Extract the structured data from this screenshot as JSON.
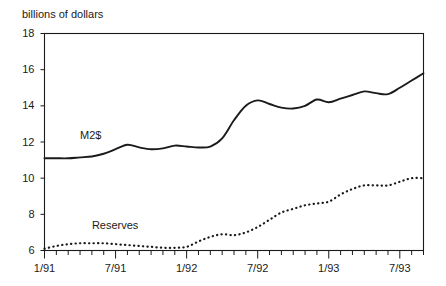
{
  "chart_data": {
    "type": "line",
    "title": "",
    "ylabel": "billions of dollars",
    "xlabel": "",
    "ylim": [
      6,
      18
    ],
    "yticks": [
      6,
      8,
      10,
      12,
      14,
      16,
      18
    ],
    "xlim": [
      "1/91",
      "9/93"
    ],
    "xticks": [
      "1/91",
      "7/91",
      "1/92",
      "7/92",
      "1/93",
      "7/93"
    ],
    "xtick_all_months": 33,
    "grid": false,
    "legend": "inline-labels",
    "x": [
      "1/91",
      "2/91",
      "3/91",
      "4/91",
      "5/91",
      "6/91",
      "7/91",
      "8/91",
      "9/91",
      "10/91",
      "11/91",
      "12/91",
      "1/92",
      "2/92",
      "3/92",
      "4/92",
      "5/92",
      "6/92",
      "7/92",
      "8/92",
      "9/92",
      "10/92",
      "11/92",
      "12/92",
      "1/93",
      "2/93",
      "3/93",
      "4/93",
      "5/93",
      "6/93",
      "7/93",
      "8/93",
      "9/93"
    ],
    "series": [
      {
        "name": "M2$",
        "style": "solid",
        "color": "#1a1a1a",
        "label_x": "4/91",
        "label_y": 12.35,
        "values": [
          11.1,
          11.1,
          11.1,
          11.15,
          11.2,
          11.35,
          11.6,
          11.85,
          11.7,
          11.6,
          11.65,
          11.8,
          11.75,
          11.7,
          11.75,
          12.2,
          13.2,
          14.0,
          14.3,
          14.1,
          13.9,
          13.85,
          14.0,
          14.35,
          14.2,
          14.4,
          14.6,
          14.8,
          14.7,
          14.65,
          15.0,
          15.4,
          15.8
        ]
      },
      {
        "name": "Reserves",
        "style": "dotted",
        "color": "#1a1a1a",
        "label_x": "5/91",
        "label_y": 7.35,
        "values": [
          6.1,
          6.25,
          6.35,
          6.4,
          6.4,
          6.4,
          6.35,
          6.3,
          6.25,
          6.2,
          6.15,
          6.15,
          6.2,
          6.5,
          6.75,
          6.9,
          6.85,
          7.0,
          7.3,
          7.7,
          8.1,
          8.3,
          8.5,
          8.6,
          8.7,
          9.1,
          9.4,
          9.6,
          9.6,
          9.6,
          9.8,
          10.0,
          10.0
        ]
      }
    ]
  }
}
